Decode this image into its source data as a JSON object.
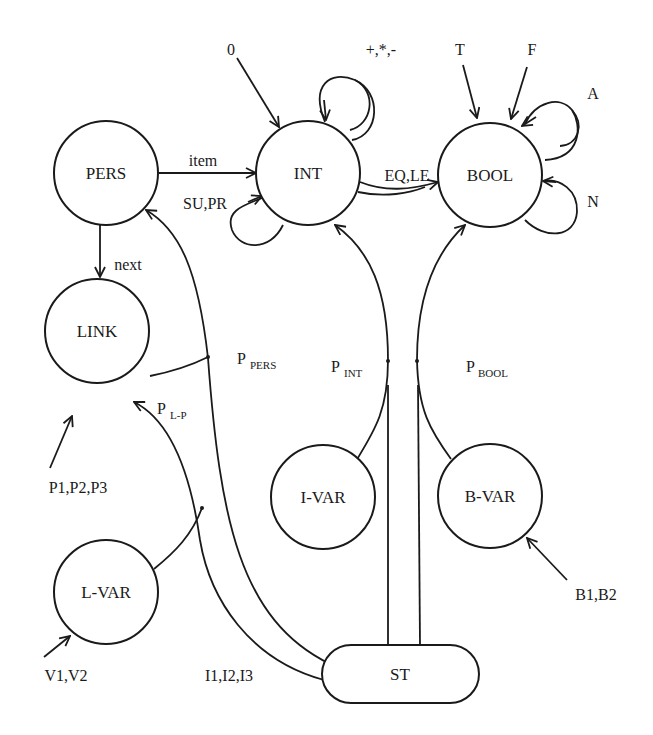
{
  "diagram": {
    "type": "signature-graph",
    "nodes": [
      {
        "id": "PERS",
        "label": "PERS",
        "shape": "circle"
      },
      {
        "id": "INT",
        "label": "INT",
        "shape": "circle"
      },
      {
        "id": "BOOL",
        "label": "BOOL",
        "shape": "circle"
      },
      {
        "id": "LINK",
        "label": "LINK",
        "shape": "circle"
      },
      {
        "id": "I-VAR",
        "label": "I-VAR",
        "shape": "circle"
      },
      {
        "id": "B-VAR",
        "label": "B-VAR",
        "shape": "circle"
      },
      {
        "id": "L-VAR",
        "label": "L-VAR",
        "shape": "circle"
      },
      {
        "id": "ST",
        "label": "ST",
        "shape": "rounded-rect"
      }
    ],
    "edges": [
      {
        "from": "PERS",
        "to": "INT",
        "label": "item"
      },
      {
        "from": "PERS",
        "to": "LINK",
        "label": "next"
      },
      {
        "from": "INT",
        "to": "INT",
        "label": "SU,PR"
      },
      {
        "from": "INT",
        "to": "INT",
        "label": "+,*,-"
      },
      {
        "from": "INT",
        "to": "BOOL",
        "label": "EQ,LE"
      },
      {
        "from": "BOOL",
        "to": "BOOL",
        "label": "A"
      },
      {
        "from": "BOOL",
        "to": "BOOL",
        "label": "N"
      },
      {
        "from": "const",
        "to": "INT",
        "label": "0"
      },
      {
        "from": "const",
        "to": "BOOL",
        "label": "T"
      },
      {
        "from": "const",
        "to": "BOOL",
        "label": "F"
      },
      {
        "from": "const",
        "to": "LINK",
        "label": "P1,P2,P3"
      },
      {
        "from": "const",
        "to": "L-VAR",
        "label": "V1,V2"
      },
      {
        "from": "const",
        "to": "B-VAR",
        "label": "B1,B2"
      },
      {
        "from": "LINK+ST",
        "to": "PERS",
        "label": "P_PERS",
        "main": "P",
        "sub": "PERS"
      },
      {
        "from": "L-VAR+ST",
        "to": "LINK",
        "label": "P_L-P",
        "main": "P",
        "sub": "L-P"
      },
      {
        "from": "I-VAR+ST",
        "to": "INT",
        "label": "P_INT",
        "main": "P",
        "sub": "INT"
      },
      {
        "from": "B-VAR+ST",
        "to": "BOOL",
        "label": "P_BOOL",
        "main": "P",
        "sub": "BOOL"
      },
      {
        "from": "ST",
        "to": "ST",
        "label": "I1,I2,I3"
      }
    ]
  },
  "labels": {
    "nodes": {
      "pers": "PERS",
      "int": "INT",
      "bool": "BOOL",
      "link": "LINK",
      "ivar": "I-VAR",
      "bvar": "B-VAR",
      "lvar": "L-VAR",
      "st": "ST"
    },
    "edges": {
      "item": "item",
      "next": "next",
      "su_pr": "SU,PR",
      "ops": "+,*,-",
      "eq_le": "EQ,LE",
      "a": "A",
      "n": "N",
      "zero": "0",
      "t": "T",
      "f": "F",
      "p123": "P1,P2,P3",
      "v12": "V1,V2",
      "b12": "B1,B2",
      "i123": "I1,I2,I3",
      "p_main": "P",
      "p_pers_sub": "PERS",
      "p_lp_sub": "L-P",
      "p_int_sub": "INT",
      "p_bool_sub": "BOOL"
    }
  }
}
